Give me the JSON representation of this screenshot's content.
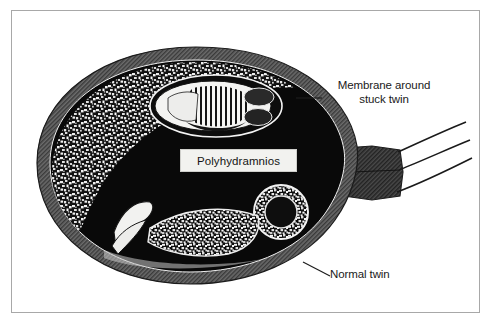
{
  "figure": {
    "type": "medical-illustration",
    "view": "sagittal cross-section of gravid uterus"
  },
  "labels": {
    "membrane": "Membrane around\nstuck twin",
    "normal_twin": "Normal twin",
    "polyhydramnios": "Polyhydramnios"
  },
  "structures": [
    {
      "name": "uterine-wall",
      "description": "thick hatched grey uterine wall"
    },
    {
      "name": "placenta",
      "description": "speckled placenta along upper-left inner wall"
    },
    {
      "name": "amniotic-fluid",
      "description": "large black polyhydramnios fluid cavity"
    },
    {
      "name": "stuck-twin",
      "description": "small fetus held against upper uterine wall inside membrane"
    },
    {
      "name": "normal-twin",
      "description": "fetus lying along the lower uterus"
    },
    {
      "name": "cervix",
      "description": "cervical canal at right with three cord lines"
    }
  ],
  "colors": {
    "frame": "#a8a8a8",
    "wall": "#595959",
    "wall_dark": "#3f3f3f",
    "fluid": "#0a0a0a",
    "placenta_light": "#e8e8e8",
    "fetus": "#f4f4f4",
    "label_box": "#f2f2ef",
    "text": "#151515",
    "background": "#ffffff"
  }
}
